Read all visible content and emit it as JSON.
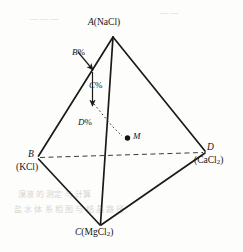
{
  "figure": {
    "background_color": "#fdfdfc",
    "line_color": "#1a1a1a",
    "vertices": [
      {
        "id": "A",
        "label_main": "A",
        "label_sub": "(NaCl)",
        "x": 113,
        "y": 36
      },
      {
        "id": "B",
        "label_main": "B",
        "label_sub": "(KCl)",
        "x": 38,
        "y": 158
      },
      {
        "id": "C",
        "label_main": "C",
        "label_sub": "(MgCl2)",
        "x": 100,
        "y": 225
      },
      {
        "id": "D",
        "label_main": "D",
        "label_sub": "(CaCl2)",
        "x": 205,
        "y": 152
      }
    ],
    "labels": {
      "vertex_a": "A(NaCl)",
      "vertex_a_italic": "A",
      "vertex_a_formula": "(NaCl)",
      "vertex_b": "B",
      "vertex_b_formula": "(KCl)",
      "vertex_c_italic": "C",
      "vertex_c_formula": "(MgCl",
      "vertex_c_sub": "2",
      "vertex_c_close": ")",
      "vertex_d": "D",
      "vertex_d_formula": "(CaCl",
      "vertex_d_sub": "2",
      "vertex_d_close": ")",
      "annot_b_percent_italic": "B",
      "annot_b_percent_unit": "%",
      "annot_c_percent_italic": "C",
      "annot_c_percent_unit": "%",
      "annot_d_percent_italic": "D",
      "annot_d_percent_unit": "%",
      "point_m": "M"
    },
    "edges": [
      {
        "name": "edge-A-B",
        "from": "A",
        "to": "B",
        "style": "solid"
      },
      {
        "name": "edge-A-C",
        "from": "A",
        "to": "C",
        "style": "solid"
      },
      {
        "name": "edge-A-D",
        "from": "A",
        "to": "D",
        "style": "solid"
      },
      {
        "name": "edge-B-C",
        "from": "B",
        "to": "C",
        "style": "solid"
      },
      {
        "name": "edge-C-D",
        "from": "C",
        "to": "D",
        "style": "solid"
      },
      {
        "name": "edge-B-D",
        "from": "B",
        "to": "D",
        "style": "dashed"
      }
    ],
    "annotations": [
      {
        "name": "b-percent-arrow",
        "label": "B%",
        "type": "arrow",
        "points_to": "edge-A-B"
      },
      {
        "name": "c-percent-arrow",
        "label": "C%",
        "type": "arrow",
        "points_to": "edge-A-C"
      },
      {
        "name": "d-percent-leader",
        "label": "D%",
        "type": "dotted-leader",
        "points_to": "point-M"
      },
      {
        "name": "point-m-marker",
        "label": "M",
        "type": "filled-dot",
        "x": 127,
        "y": 138
      }
    ],
    "ghost_text": [
      {
        "text": "溴液 的 测定 与 计算",
        "x": 18,
        "y": 192
      },
      {
        "text": "盐 水 体 系 相 图 与 结 晶 路 径",
        "x": 14,
        "y": 207
      },
      {
        "text": "— — —",
        "x": 30,
        "y": 18
      },
      {
        "text": "— —",
        "x": 160,
        "y": 12
      }
    ]
  }
}
